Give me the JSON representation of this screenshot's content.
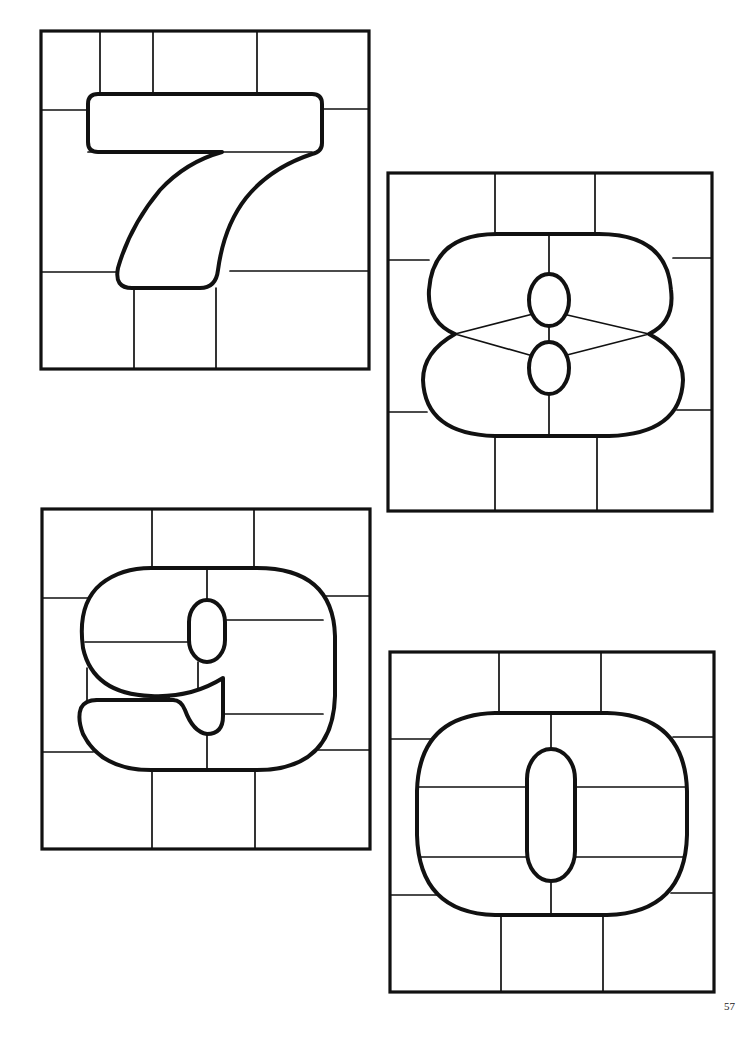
{
  "page": {
    "number": "57",
    "background": "#ffffff",
    "line_color": "#111111"
  },
  "panels": [
    {
      "id": "seven",
      "digit": "7",
      "label": "Stained glass pattern - digit 7",
      "position": "top-left"
    },
    {
      "id": "eight",
      "digit": "8",
      "label": "Stained glass pattern - digit 8",
      "position": "upper-right"
    },
    {
      "id": "nine",
      "digit": "9",
      "label": "Stained glass pattern - digit 9",
      "position": "lower-left"
    },
    {
      "id": "zero",
      "digit": "0",
      "label": "Stained glass pattern - digit 0",
      "position": "bottom-right"
    }
  ]
}
